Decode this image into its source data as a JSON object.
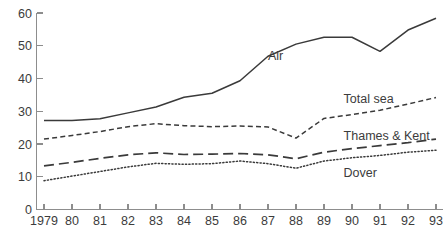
{
  "chart_data": {
    "type": "line",
    "title": "",
    "subtitle": "",
    "xlabel": "",
    "ylabel": "",
    "xlim": [
      1979,
      1993
    ],
    "ylim": [
      0,
      60
    ],
    "grid": false,
    "legend_position": "inline-labels",
    "x": [
      1979,
      1980,
      1981,
      1982,
      1983,
      1984,
      1985,
      1986,
      1987,
      1988,
      1989,
      1990,
      1991,
      1992,
      1993
    ],
    "x_tick_labels": [
      "1979",
      "80",
      "81",
      "82",
      "83",
      "84",
      "85",
      "86",
      "87",
      "88",
      "89",
      "90",
      "91",
      "92",
      "93"
    ],
    "y_ticks": [
      0,
      10,
      20,
      30,
      40,
      50,
      60
    ],
    "y_tick_labels": [
      "0",
      "10",
      "20",
      "30",
      "40",
      "50",
      "60"
    ],
    "series": [
      {
        "name": "Air",
        "label": "Air",
        "style": "solid",
        "color": "#3a3a3a",
        "label_x": 1987.0,
        "label_y": 47.0,
        "values": [
          27.2,
          27.2,
          27.7,
          29.5,
          31.3,
          34.3,
          35.5,
          39.3,
          46.8,
          50.5,
          52.6,
          52.6,
          48.3,
          54.8,
          58.4
        ]
      },
      {
        "name": "Total sea",
        "label": "Total sea",
        "style": "dash",
        "color": "#3a3a3a",
        "label_x": 1989.7,
        "label_y": 33.8,
        "values": [
          21.5,
          22.6,
          23.8,
          25.3,
          26.2,
          25.6,
          25.3,
          25.5,
          25.2,
          21.8,
          27.8,
          29.0,
          30.3,
          32.2,
          34.2
        ]
      },
      {
        "name": "Thames & Kent",
        "label": "Thames & Kent",
        "style": "longdash",
        "color": "#3a3a3a",
        "label_x": 1989.7,
        "label_y": 22.6,
        "values": [
          13.3,
          14.4,
          15.6,
          16.7,
          17.3,
          16.8,
          16.9,
          17.1,
          16.7,
          15.5,
          17.5,
          18.6,
          19.5,
          20.4,
          21.5
        ]
      },
      {
        "name": "Dover",
        "label": "Dover",
        "style": "dot",
        "color": "#3a3a3a",
        "label_x": 1989.7,
        "label_y": 11.4,
        "values": [
          8.8,
          10.2,
          11.6,
          13.0,
          14.1,
          13.8,
          14.0,
          14.8,
          14.0,
          12.6,
          14.8,
          15.8,
          16.5,
          17.5,
          18.1
        ]
      }
    ]
  },
  "axes": {
    "y_axis_name": "y-axis",
    "x_axis_name": "x-axis"
  }
}
